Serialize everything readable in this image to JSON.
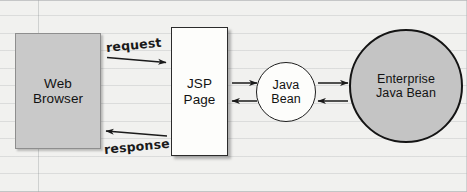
{
  "diagram": {
    "background": {
      "style": "lined-paper",
      "paper_color": "#f1f1ef",
      "rule_color": "#787d82"
    },
    "nodes": [
      {
        "id": "web-browser",
        "label": "Web\nBrowser",
        "shape": "rectangle",
        "fill": "#c9c9c9",
        "stroke": "#8e8e8e"
      },
      {
        "id": "jsp-page",
        "label": "JSP\nPage",
        "shape": "rectangle",
        "fill": "#fdfdfb",
        "stroke": "#2b2b2b"
      },
      {
        "id": "java-bean",
        "label": "Java\nBean",
        "shape": "circle",
        "fill": "#fdfdfb",
        "stroke": "#1f1f1f"
      },
      {
        "id": "enterprise-java-bean",
        "label": "Enterprise\nJava Bean",
        "shape": "circle",
        "fill": "#c4c4c4",
        "stroke": "#141414"
      }
    ],
    "edges": [
      {
        "id": "request",
        "label": "request",
        "from": "web-browser",
        "to": "jsp-page",
        "direction": "right"
      },
      {
        "id": "response",
        "label": "response",
        "from": "jsp-page",
        "to": "web-browser",
        "direction": "left"
      },
      {
        "id": "jsp-to-bean",
        "label": "",
        "from": "jsp-page",
        "to": "java-bean",
        "direction": "right"
      },
      {
        "id": "bean-to-jsp",
        "label": "",
        "from": "java-bean",
        "to": "jsp-page",
        "direction": "left"
      },
      {
        "id": "bean-to-ejb",
        "label": "",
        "from": "java-bean",
        "to": "enterprise-java-bean",
        "direction": "right"
      },
      {
        "id": "ejb-to-bean",
        "label": "",
        "from": "enterprise-java-bean",
        "to": "java-bean",
        "direction": "left"
      }
    ]
  }
}
